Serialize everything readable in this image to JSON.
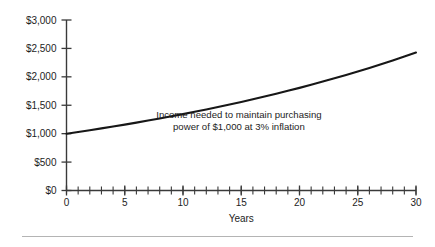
{
  "chart_data": {
    "type": "line",
    "title": "",
    "subtitle": "",
    "xlabel": "Years",
    "ylabel": "",
    "xlim": [
      0,
      30
    ],
    "ylim": [
      0,
      3000
    ],
    "grid": false,
    "legend": null,
    "legend_position": "none",
    "x_tick_labels": [
      "0",
      "5",
      "10",
      "15",
      "20",
      "25",
      "30"
    ],
    "x_tick_values": [
      0,
      5,
      10,
      15,
      20,
      25,
      30
    ],
    "x_minor_tick_step": 1,
    "y_tick_labels": [
      "$0",
      "$500",
      "$1,000",
      "$1,500",
      "$2,000",
      "$2,500",
      "$3,000"
    ],
    "y_tick_values": [
      0,
      500,
      1000,
      1500,
      2000,
      2500,
      3000
    ],
    "annotations": [
      {
        "line1": "Income needed to maintain purchasing",
        "line2": "power of $1,000 at 3% inflation",
        "x": 14.8,
        "y": 1280
      }
    ],
    "series": [
      {
        "name": "Income needed to maintain purchasing power of $1,000 at 3% inflation",
        "color": "#171717",
        "x": [
          0,
          1,
          2,
          3,
          4,
          5,
          6,
          7,
          8,
          9,
          10,
          11,
          12,
          13,
          14,
          15,
          16,
          17,
          18,
          19,
          20,
          21,
          22,
          23,
          24,
          25,
          26,
          27,
          28,
          29,
          30
        ],
        "values": [
          1000,
          1030,
          1061,
          1093,
          1126,
          1159,
          1194,
          1230,
          1267,
          1305,
          1344,
          1384,
          1426,
          1469,
          1513,
          1558,
          1605,
          1653,
          1702,
          1754,
          1806,
          1860,
          1916,
          1974,
          2033,
          2094,
          2157,
          2221,
          2288,
          2357,
          2427
        ]
      }
    ]
  },
  "figure": {
    "axis_color": "#3a3a3a",
    "text_color": "#1d1d1d",
    "background": "#ffffff",
    "footer_rule_color": "#b4b4b4"
  }
}
